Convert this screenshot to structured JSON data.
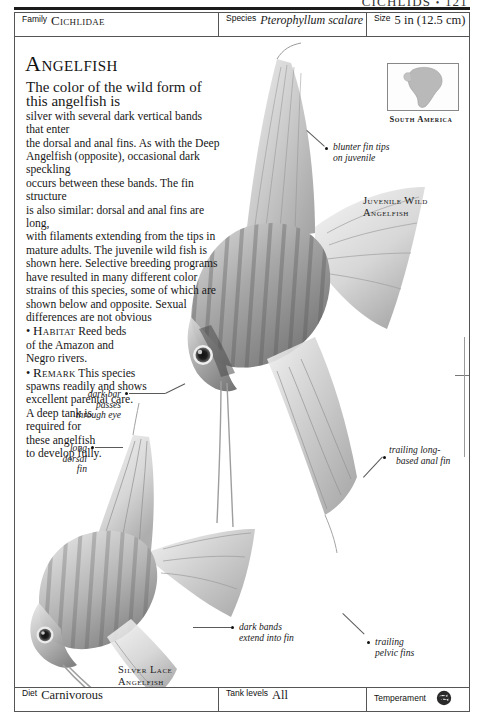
{
  "running_head": {
    "section": "CICHLIDS",
    "separator": "•",
    "page_number": "121"
  },
  "info_bar": {
    "family": {
      "label": "Family",
      "value": "Cichlidae"
    },
    "species": {
      "label": "Species",
      "value": "Pterophyllum scalare"
    },
    "size": {
      "label": "Size",
      "value": "5 in (12.5 cm)"
    }
  },
  "bottom_bar": {
    "diet": {
      "label": "Diet",
      "value": "Carnivorous"
    },
    "tank_levels": {
      "label": "Tank levels",
      "value": "All"
    },
    "temperament": {
      "label": "Temperament",
      "icon": "fish-shoal-icon"
    }
  },
  "article": {
    "title": "Angelfish",
    "paragraph_lines": [
      "The color of the wild form of this angelfish is",
      "silver with several dark vertical bands that enter",
      "the dorsal and anal fins. As with the Deep",
      "Angelfish (opposite), occasional dark speckling",
      "occurs between these bands. The fin structure",
      "is also similar: dorsal and anal fins are long,",
      "with filaments extending from the tips in",
      "mature adults. The juvenile wild fish is",
      "shown here. Selective breeding programs",
      "have resulted in many different color",
      "strains of this species, some of which are",
      "shown below and opposite. Sexual",
      "differences are not obvious"
    ],
    "bullets": [
      {
        "marker": "•",
        "heading": "Habitat",
        "lines": [
          "Reed beds",
          "of the Amazon and",
          "Negro rivers."
        ]
      },
      {
        "marker": "•",
        "heading": "Remark",
        "lines": [
          "This species",
          "spawns readily and shows",
          "excellent parental care.",
          "A deep tank is",
          "required for",
          "these angelfish",
          "to develop fully."
        ]
      }
    ]
  },
  "map": {
    "label": "South America",
    "region": "south-america-outline"
  },
  "callouts": [
    {
      "id": "blunter-fin-tips",
      "lines": [
        "blunter fin tips",
        "on juvenile"
      ]
    },
    {
      "id": "dark-bar-eye",
      "lines": [
        "dark bar",
        "passes",
        "through eye"
      ]
    },
    {
      "id": "long-dorsal-fin",
      "lines": [
        "long",
        "dorsal",
        "fin"
      ]
    },
    {
      "id": "trailing-anal-fin",
      "lines": [
        "trailing long-",
        "based anal fin"
      ]
    },
    {
      "id": "dark-bands-fin",
      "lines": [
        "dark bands",
        "extend into fin"
      ]
    },
    {
      "id": "trailing-pelvic-fins",
      "lines": [
        "trailing",
        "pelvic fins"
      ]
    }
  ],
  "captions": [
    {
      "id": "juvenile-wild-angelfish",
      "lines": [
        "Juvenile Wild",
        "Angelfish"
      ]
    },
    {
      "id": "silver-lace-angelfish",
      "lines": [
        "Silver Lace",
        "Angelfish"
      ]
    }
  ],
  "colors": {
    "rule": "#1b1b1b",
    "border": "#555555",
    "text": "#1a1a1a",
    "leader": "#5a5a5a"
  }
}
